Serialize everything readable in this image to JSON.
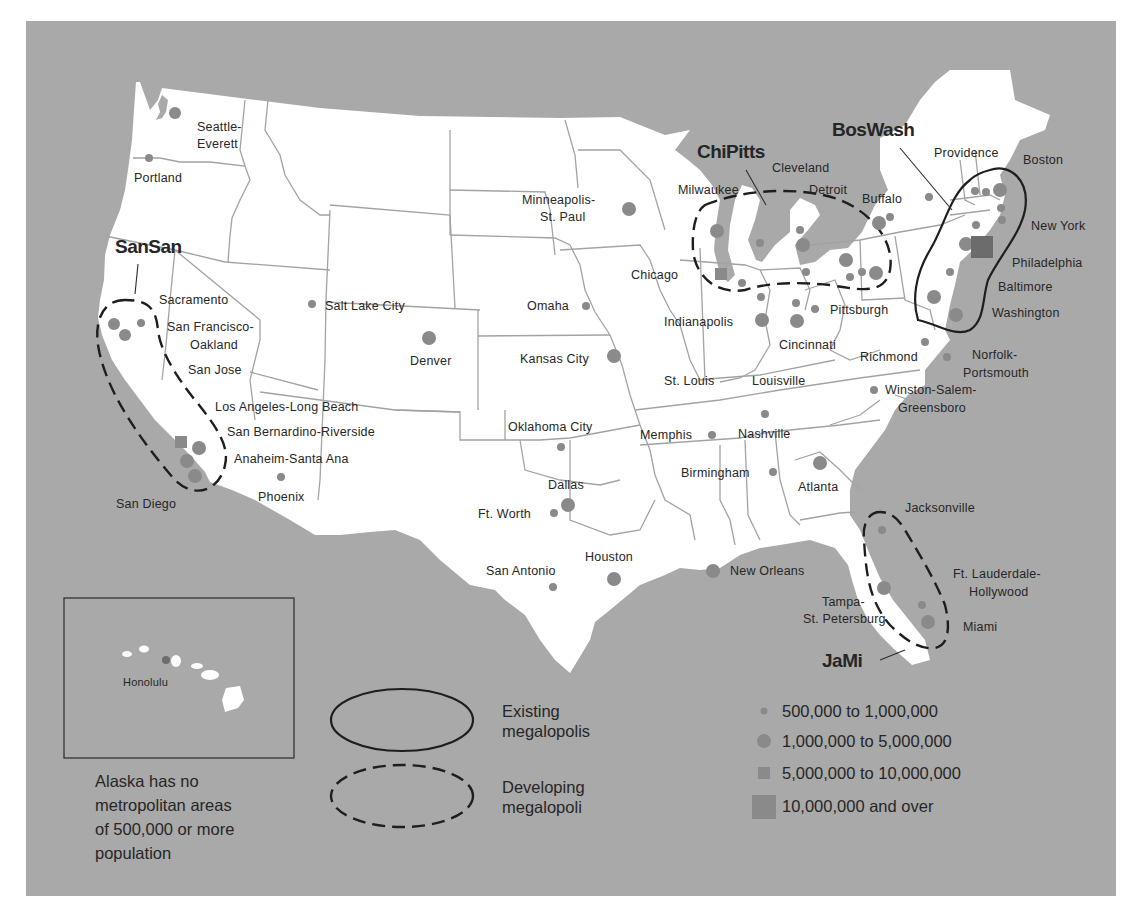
{
  "megalopolises": [
    {
      "id": "sansan",
      "name": "SanSan",
      "status": "Developing"
    },
    {
      "id": "chipitts",
      "name": "ChiPitts",
      "status": "Developing"
    },
    {
      "id": "boswash",
      "name": "BosWash",
      "status": "Existing"
    },
    {
      "id": "jami",
      "name": "JaMi",
      "status": "Developing"
    }
  ],
  "labels": {
    "seattle": "Seattle-",
    "seattle2": "Everett",
    "portland": "Portland",
    "sacramento": "Sacramento",
    "sf": "San Francisco-",
    "sf2": "Oakland",
    "sanjose": "San Jose",
    "la": "Los Angeles-Long Beach",
    "sb": "San Bernardino-Riverside",
    "anaheim": "Anaheim-Santa Ana",
    "sandiego": "San Diego",
    "phoenix": "Phoenix",
    "slc": "Salt Lake City",
    "denver": "Denver",
    "minneapolis": "Minneapolis-",
    "minneapolis2": "St. Paul",
    "omaha": "Omaha",
    "kansascity": "Kansas City",
    "okc": "Oklahoma City",
    "dallas": "Dallas",
    "ftworth": "Ft. Worth",
    "sanantonio": "San Antonio",
    "houston": "Houston",
    "neworleans": "New Orleans",
    "memphis": "Memphis",
    "nashville": "Nashville",
    "birmingham": "Birmingham",
    "atlanta": "Atlanta",
    "stlouis": "St. Louis",
    "louisville": "Louisville",
    "indianapolis": "Indianapolis",
    "cincinnati": "Cincinnati",
    "chicago": "Chicago",
    "milwaukee": "Milwaukee",
    "cleveland": "Cleveland",
    "detroit": "Detroit",
    "buffalo": "Buffalo",
    "pittsburgh": "Pittsburgh",
    "richmond": "Richmond",
    "norfolk": "Norfolk-",
    "norfolk2": "Portsmouth",
    "winston": "Winston-Salem-",
    "winston2": "Greensboro",
    "providence": "Providence",
    "boston": "Boston",
    "newyork": "New York",
    "philadelphia": "Philadelphia",
    "baltimore": "Baltimore",
    "washington": "Washington",
    "jacksonville": "Jacksonville",
    "tampa": "Tampa-",
    "tampa2": "St. Petersburg",
    "ftlauderdale": "Ft. Lauderdale-",
    "ftlauderdale2": "Hollywood",
    "miami": "Miami",
    "honolulu": "Honolulu"
  },
  "alaska_note": [
    "Alaska has no",
    "metropolitan areas",
    "of 500,000 or more",
    "population"
  ],
  "legend_outlines": [
    {
      "style": "solid",
      "line1": "Existing",
      "line2": "megalopolis"
    },
    {
      "style": "dashed",
      "line1": "Developing",
      "line2": "megalopoli"
    }
  ],
  "legend_sizes": [
    {
      "symbol": "small-circle",
      "label": "500,000 to 1,000,000"
    },
    {
      "symbol": "large-circle",
      "label": "1,000,000 to 5,000,000"
    },
    {
      "symbol": "small-square",
      "label": "5,000,000 to 10,000,000"
    },
    {
      "symbol": "large-square",
      "label": "10,000,000 and over"
    }
  ],
  "cities": [
    {
      "name": "Seattle-Everett",
      "size": "1M-5M"
    },
    {
      "name": "Portland",
      "size": "500K-1M"
    },
    {
      "name": "Sacramento",
      "size": "500K-1M"
    },
    {
      "name": "San Francisco-Oakland",
      "size": "1M-5M"
    },
    {
      "name": "San Jose",
      "size": "1M-5M"
    },
    {
      "name": "Los Angeles-Long Beach",
      "size": "5M-10M"
    },
    {
      "name": "San Bernardino-Riverside",
      "size": "1M-5M"
    },
    {
      "name": "Anaheim-Santa Ana",
      "size": "1M-5M"
    },
    {
      "name": "San Diego",
      "size": "1M-5M"
    },
    {
      "name": "Phoenix",
      "size": "500K-1M"
    },
    {
      "name": "Salt Lake City",
      "size": "500K-1M"
    },
    {
      "name": "Denver",
      "size": "1M-5M"
    },
    {
      "name": "Minneapolis-St. Paul",
      "size": "1M-5M"
    },
    {
      "name": "Omaha",
      "size": "500K-1M"
    },
    {
      "name": "Kansas City",
      "size": "1M-5M"
    },
    {
      "name": "Oklahoma City",
      "size": "500K-1M"
    },
    {
      "name": "Dallas",
      "size": "1M-5M"
    },
    {
      "name": "Ft. Worth",
      "size": "500K-1M"
    },
    {
      "name": "San Antonio",
      "size": "500K-1M"
    },
    {
      "name": "Houston",
      "size": "1M-5M"
    },
    {
      "name": "New Orleans",
      "size": "1M-5M"
    },
    {
      "name": "Memphis",
      "size": "500K-1M"
    },
    {
      "name": "Nashville",
      "size": "500K-1M"
    },
    {
      "name": "Birmingham",
      "size": "500K-1M"
    },
    {
      "name": "Atlanta",
      "size": "1M-5M"
    },
    {
      "name": "Chicago",
      "size": "5M-10M"
    },
    {
      "name": "New York",
      "size": "10M+"
    },
    {
      "name": "Honolulu",
      "size": "500K-1M"
    }
  ],
  "colors": {
    "water": "#a9a9a9",
    "land": "#ffffff",
    "dot": "#8a8a8a",
    "text": "#262626"
  }
}
